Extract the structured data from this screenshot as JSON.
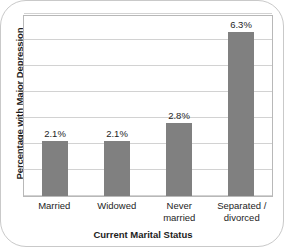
{
  "chart_data": {
    "type": "bar",
    "title": "",
    "xlabel": "Current Marital Status",
    "ylabel": "Percentage with Major Depression",
    "categories": [
      "Married",
      "Widowed",
      "Never married",
      "Separated / divorced"
    ],
    "category_lines": [
      [
        "Married"
      ],
      [
        "Widowed"
      ],
      [
        "Never",
        "married"
      ],
      [
        "Separated /",
        "divorced"
      ]
    ],
    "values": [
      2.1,
      2.1,
      2.8,
      6.3
    ],
    "value_labels": [
      "2.1%",
      "2.1%",
      "2.8%",
      "6.3%"
    ],
    "ylim": [
      0,
      7
    ],
    "y_tick_values": [
      0,
      1,
      2,
      3,
      4,
      5,
      6,
      7
    ],
    "y_tick_labels": [],
    "grid": true,
    "legend": false,
    "legend_position": "none",
    "bar_color": "#808080",
    "gridline_color": "#d2d2d2",
    "frame_color": "#b8b8b8"
  }
}
